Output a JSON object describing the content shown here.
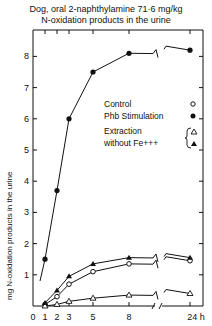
{
  "chart_data": {
    "type": "line",
    "title": "Dog, oral 2-naphthylamine 71·6 mg/kg",
    "subtitle": "N-oxidation products in the urine",
    "xlabel": "h",
    "ylabel": "mg N-oxidation products in the urine",
    "x_ticks": [
      "0",
      "1",
      "2",
      "3",
      "5",
      "8",
      "24 h"
    ],
    "y_ticks": [
      "1",
      "2",
      "3",
      "4",
      "5",
      "6",
      "7",
      "8"
    ],
    "ylim": [
      0,
      8.8
    ],
    "x": [
      1,
      2,
      3,
      5,
      8,
      24
    ],
    "axis_break": "between 8 and 24 h",
    "grid": false,
    "legend_position": "upper right inside",
    "series": [
      {
        "name": "Control",
        "marker": "open-circle",
        "values": [
          0.05,
          0.3,
          0.7,
          1.1,
          1.35,
          1.45
        ]
      },
      {
        "name": "Phb Stimulation",
        "marker": "filled-circle",
        "values": [
          1.5,
          3.7,
          6.0,
          7.5,
          8.1,
          8.2
        ]
      },
      {
        "name": "Extraction without Fe+++ (Control)",
        "marker": "open-triangle",
        "values": [
          0.0,
          0.05,
          0.15,
          0.25,
          0.35,
          0.4
        ]
      },
      {
        "name": "Extraction without Fe+++ (Phb Stimulation)",
        "marker": "filled-triangle",
        "values": [
          0.1,
          0.5,
          0.95,
          1.35,
          1.55,
          1.55
        ]
      }
    ]
  },
  "title_line1": "Dog, oral 2-naphthylamine 71·6 mg/kg",
  "title_line2": "N-oxidation products in the urine",
  "legend": {
    "control": "Control",
    "phb": "Phb Stimulation",
    "extraction_line1": "Extraction",
    "extraction_line2": "without Fe+++"
  },
  "axis": {
    "ylabel": "mg N-oxidation products in the urine",
    "x_labels": [
      "0",
      "1",
      "2",
      "3",
      "5",
      "8",
      "24 h"
    ],
    "y_labels": [
      "1",
      "2",
      "3",
      "4",
      "5",
      "6",
      "7",
      "8"
    ]
  },
  "colors": {
    "ink": "#111111",
    "background": "#ffffff"
  }
}
